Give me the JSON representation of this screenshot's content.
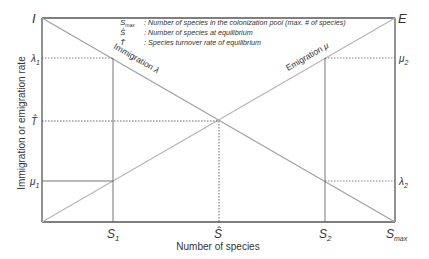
{
  "diagram": {
    "y_axis_label": "Immigration or emigration rate",
    "x_axis_label": "Number of species",
    "corner_labels": {
      "top_left": "I",
      "top_right": "E"
    },
    "lines": {
      "immigration": {
        "label": "Immigration",
        "symbol": "λ"
      },
      "emigration": {
        "label": "Emigration",
        "symbol": "μ"
      }
    },
    "left_ticks": [
      {
        "base": "λ",
        "sub": "1"
      },
      {
        "base": "T̂",
        "sub": ""
      },
      {
        "base": "μ",
        "sub": "1"
      }
    ],
    "right_ticks": [
      {
        "base": "μ",
        "sub": "2"
      },
      {
        "base": "λ",
        "sub": "2"
      }
    ],
    "bottom_ticks": [
      {
        "base": "S",
        "sub": "1"
      },
      {
        "base": "Ŝ",
        "sub": ""
      },
      {
        "base": "S",
        "sub": "2"
      },
      {
        "base": "S",
        "sub": "max"
      }
    ],
    "legend": [
      {
        "symbol": "S",
        "sub": "max",
        "text": ": Number of species in the colonization pool (max. # of species)"
      },
      {
        "symbol": "Ŝ",
        "sub": "",
        "text": ": Number of species at equilibrium"
      },
      {
        "symbol": "T̂",
        "sub": "",
        "text": ": Species turnover rate of equilibrium"
      }
    ],
    "colors": {
      "frame": "#555555",
      "rate_lines": "#a0a0a0",
      "guides": "#666666",
      "text": "#333333"
    }
  }
}
